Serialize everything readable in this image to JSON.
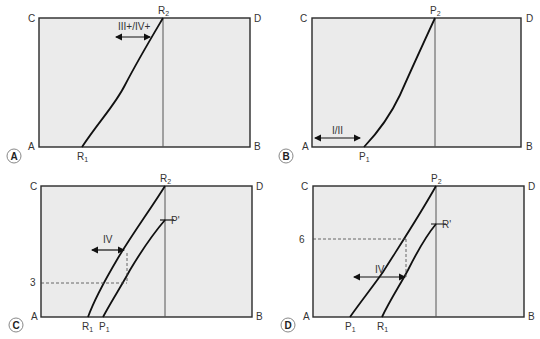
{
  "panels": [
    {
      "id": "A",
      "corners": {
        "top_left": "C",
        "top_right": "D",
        "bottom_left": "A",
        "bottom_right": "B"
      },
      "curves": [
        {
          "start_label": "R",
          "start_sub": "1",
          "end_label": "R",
          "end_sub": "2"
        }
      ],
      "arrow_label": "III+/IV+"
    },
    {
      "id": "B",
      "corners": {
        "top_left": "C",
        "top_right": "D",
        "bottom_left": "A",
        "bottom_right": "B"
      },
      "curves": [
        {
          "start_label": "P",
          "start_sub": "1",
          "end_label": "P",
          "end_sub": "2"
        }
      ],
      "arrow_label": "I/II"
    },
    {
      "id": "C",
      "corners": {
        "top_left": "C",
        "top_right": "D",
        "bottom_left": "A",
        "bottom_right": "B"
      },
      "curves": [
        {
          "start_label": "R",
          "start_sub": "1",
          "end_label": "R",
          "end_sub": "2"
        },
        {
          "start_label": "P",
          "start_sub": "1",
          "end_label": "P'",
          "end_sub": ""
        }
      ],
      "arrow_label": "IV",
      "level_label": "3"
    },
    {
      "id": "D",
      "corners": {
        "top_left": "C",
        "top_right": "D",
        "bottom_left": "A",
        "bottom_right": "B"
      },
      "curves": [
        {
          "start_label": "P",
          "start_sub": "1",
          "end_label": "P",
          "end_sub": "2"
        },
        {
          "start_label": "R",
          "start_sub": "1",
          "end_label": "R'",
          "end_sub": ""
        }
      ],
      "arrow_label": "IV",
      "level_label": "6"
    }
  ],
  "colors": {
    "box_fill": "#ebebeb",
    "line": "#111111",
    "frame": "#2a2a2a"
  }
}
